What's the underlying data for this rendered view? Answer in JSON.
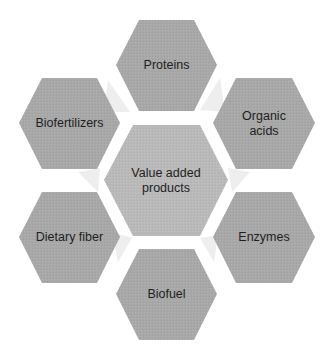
{
  "colors": {
    "hex_fill": "#a8a8a8",
    "center_fill": "#b9b9b9",
    "connector_fill": "#eeeeee",
    "text": "#1e1e1e",
    "background": "#ffffff"
  },
  "center": {
    "label": "Value added products"
  },
  "nodes": [
    {
      "id": "proteins",
      "label": "Proteins"
    },
    {
      "id": "organic-acids",
      "label": "Organic acids"
    },
    {
      "id": "enzymes",
      "label": "Enzymes"
    },
    {
      "id": "biofuel",
      "label": "Biofuel"
    },
    {
      "id": "dietary-fiber",
      "label": "Dietary fiber"
    },
    {
      "id": "biofertilizers",
      "label": "Biofertilizers"
    }
  ]
}
